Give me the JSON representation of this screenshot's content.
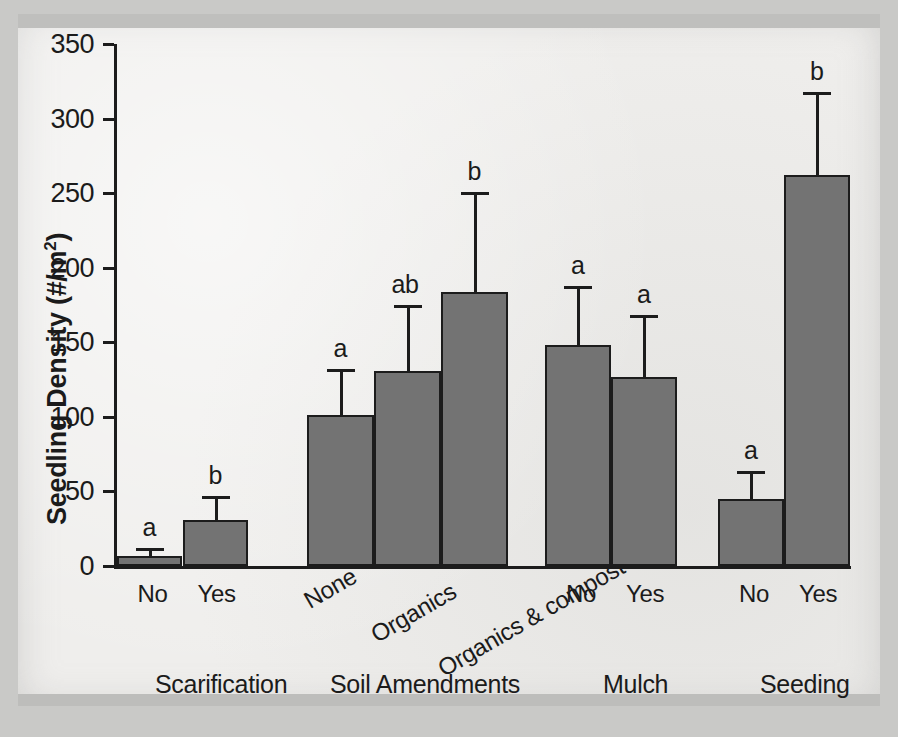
{
  "chart_data": {
    "type": "bar",
    "title": "",
    "xlabel": "",
    "ylabel": "Seedling Density (#/m2)",
    "ylabel_base": "Seedling Density (#/m",
    "ylabel_sup": "2",
    "ylabel_close": ")",
    "ylim": [
      0,
      350
    ],
    "ytick_labels": [
      "0",
      "50",
      "100",
      "150",
      "200",
      "250",
      "300",
      "350"
    ],
    "ytick_values": [
      0,
      50,
      100,
      150,
      200,
      250,
      300,
      350
    ],
    "grid": false,
    "legend": "none",
    "error_bars": "upper only (standard error)",
    "groups": [
      {
        "name": "Scarification",
        "categories": [
          "No",
          "Yes"
        ],
        "values": [
          7,
          31
        ],
        "error_upper": [
          12,
          47
        ],
        "significance": [
          "a",
          "b"
        ],
        "rotated_labels": false
      },
      {
        "name": "Soil Amendments",
        "categories": [
          "None",
          "Organics",
          "Organics & compost"
        ],
        "values": [
          101,
          131,
          184
        ],
        "error_upper": [
          132,
          175,
          251
        ],
        "significance": [
          "a",
          "ab",
          "b"
        ],
        "rotated_labels": true
      },
      {
        "name": "Mulch",
        "categories": [
          "No",
          "Yes"
        ],
        "values": [
          148,
          127
        ],
        "error_upper": [
          188,
          168
        ],
        "significance": [
          "a",
          "a"
        ],
        "rotated_labels": false
      },
      {
        "name": "Seeding",
        "categories": [
          "No",
          "Yes"
        ],
        "values": [
          45,
          262
        ],
        "error_upper": [
          64,
          318
        ],
        "significance": [
          "a",
          "b"
        ],
        "rotated_labels": false
      }
    ],
    "colors": {
      "bar_fill": "#737373",
      "bar_stroke": "#1c1c1c",
      "axis": "#1c1c1c",
      "text": "#1b1b1b",
      "page_background": "#c9c9c7",
      "sheet_background": "#efeeec"
    }
  }
}
